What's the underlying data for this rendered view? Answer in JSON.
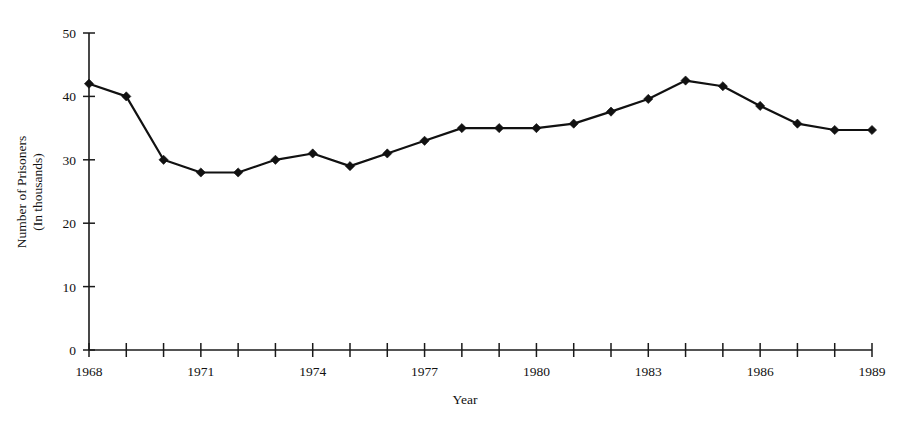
{
  "chart_data": {
    "type": "line",
    "title": "",
    "xlabel": "Year",
    "ylabel": "Number of Prisoners (In thousands)",
    "ylabel_line1": "Number of Prisoners",
    "ylabel_line2": "(In thousands)",
    "x": [
      1968,
      1969,
      1970,
      1971,
      1972,
      1973,
      1974,
      1975,
      1976,
      1977,
      1978,
      1979,
      1980,
      1981,
      1982,
      1983,
      1984,
      1985,
      1986,
      1987,
      1988,
      1989
    ],
    "values": [
      42.0,
      40.0,
      30.0,
      28.0,
      28.0,
      30.0,
      31.0,
      29.0,
      31.0,
      33.0,
      35.0,
      35.0,
      35.0,
      35.7,
      37.6,
      39.6,
      42.5,
      41.6,
      38.5,
      35.7,
      34.7,
      34.7
    ],
    "xlim": [
      1968,
      1989
    ],
    "ylim": [
      0,
      50
    ],
    "ytick_values": [
      0,
      10,
      20,
      30,
      40,
      50
    ],
    "ytick_labels": [
      "0",
      "10",
      "20",
      "30",
      "40",
      "50"
    ],
    "xtick_values": [
      1968,
      1969,
      1970,
      1971,
      1972,
      1973,
      1974,
      1975,
      1976,
      1977,
      1978,
      1979,
      1980,
      1981,
      1982,
      1983,
      1984,
      1985,
      1986,
      1987,
      1988,
      1989
    ],
    "xtick_labeled_values": [
      1968,
      1971,
      1974,
      1977,
      1980,
      1983,
      1986,
      1989
    ],
    "xtick_labels": [
      "1968",
      "1971",
      "1974",
      "1977",
      "1980",
      "1983",
      "1986",
      "1989"
    ],
    "grid": false,
    "legend": null,
    "marker": "diamond",
    "line_color": "#111111",
    "marker_color": "#111111",
    "background_color": "#ffffff"
  },
  "axis": {
    "x_title": "Year",
    "y_title_line1": "Number of Prisoners",
    "y_title_line2": "(In thousands)"
  }
}
